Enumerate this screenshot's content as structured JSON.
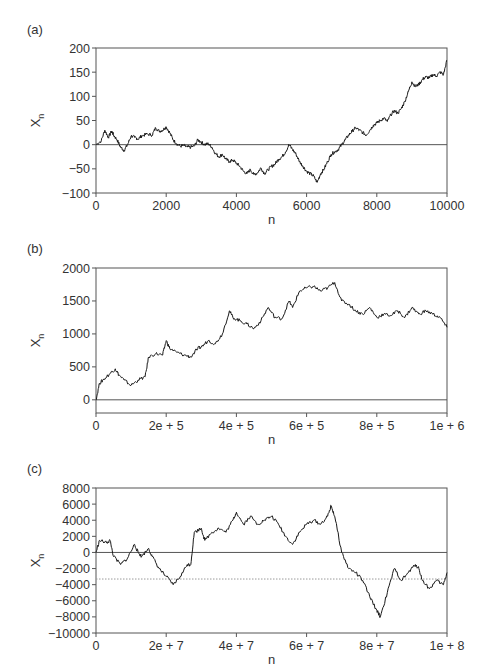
{
  "chart_data": [
    {
      "panel": "(a)",
      "type": "line",
      "title": "",
      "xlabel": "n",
      "ylabel": "X_n",
      "xlim": [
        0,
        10000
      ],
      "ylim": [
        -100,
        200
      ],
      "xticks": [
        "0",
        "2000",
        "4000",
        "6000",
        "8000",
        "10000"
      ],
      "yticks": [
        "200",
        "150",
        "100",
        "50",
        "0",
        "−50",
        "−100"
      ],
      "grid": false,
      "reference_lines": [
        {
          "y": 0,
          "style": "solid"
        }
      ],
      "series": [
        {
          "name": "random walk",
          "x": [
            0,
            150,
            250,
            350,
            450,
            500,
            600,
            700,
            800,
            900,
            1000,
            1100,
            1200,
            1300,
            1450,
            1600,
            1700,
            1800,
            1900,
            2000,
            2100,
            2200,
            2300,
            2400,
            2500,
            2600,
            2700,
            2800,
            2900,
            3000,
            3100,
            3200,
            3300,
            3400,
            3500,
            3600,
            3700,
            3800,
            3900,
            4000,
            4100,
            4200,
            4300,
            4400,
            4500,
            4600,
            4700,
            4800,
            4900,
            5000,
            5100,
            5200,
            5300,
            5400,
            5500,
            5600,
            5700,
            5800,
            5900,
            6000,
            6100,
            6200,
            6300,
            6400,
            6500,
            6600,
            6700,
            6800,
            6900,
            7000,
            7100,
            7200,
            7300,
            7400,
            7500,
            7600,
            7700,
            7800,
            7900,
            8000,
            8100,
            8200,
            8300,
            8400,
            8500,
            8600,
            8700,
            8800,
            8900,
            9000,
            9100,
            9200,
            9300,
            9400,
            9500,
            9600,
            9700,
            9800,
            9900,
            10000
          ],
          "values": [
            0,
            8,
            30,
            15,
            28,
            20,
            10,
            -5,
            -12,
            0,
            18,
            15,
            12,
            18,
            22,
            20,
            35,
            28,
            30,
            37,
            25,
            10,
            2,
            -3,
            -2,
            -5,
            -5,
            -3,
            10,
            5,
            0,
            2,
            -5,
            -18,
            -25,
            -20,
            -30,
            -35,
            -32,
            -38,
            -45,
            -55,
            -60,
            -52,
            -62,
            -58,
            -48,
            -60,
            -52,
            -45,
            -40,
            -30,
            -25,
            -15,
            0,
            -10,
            -20,
            -35,
            -45,
            -55,
            -60,
            -65,
            -78,
            -60,
            -50,
            -35,
            -20,
            -15,
            -10,
            0,
            10,
            20,
            28,
            35,
            30,
            25,
            20,
            30,
            40,
            45,
            50,
            55,
            48,
            62,
            70,
            65,
            75,
            90,
            110,
            130,
            120,
            125,
            135,
            140,
            138,
            145,
            142,
            150,
            145,
            175
          ]
        }
      ]
    },
    {
      "panel": "(b)",
      "type": "line",
      "title": "",
      "xlabel": "n",
      "ylabel": "X_n",
      "xlim": [
        0,
        1000000
      ],
      "ylim": [
        -200,
        2000
      ],
      "xticks": [
        "0",
        "2e+5",
        "4e+5",
        "6e+5",
        "8e+5",
        "1e+6"
      ],
      "yticks": [
        "2000",
        "1500",
        "1000",
        "500",
        "0"
      ],
      "grid": false,
      "reference_lines": [
        {
          "y": 0,
          "style": "solid"
        }
      ],
      "series": [
        {
          "name": "random walk",
          "x": [
            0,
            10000,
            20000,
            40000,
            55000,
            65000,
            80000,
            100000,
            120000,
            140000,
            150000,
            170000,
            190000,
            200000,
            210000,
            230000,
            250000,
            270000,
            290000,
            300000,
            320000,
            340000,
            360000,
            380000,
            390000,
            410000,
            430000,
            450000,
            470000,
            490000,
            510000,
            530000,
            550000,
            560000,
            580000,
            600000,
            620000,
            640000,
            660000,
            680000,
            700000,
            720000,
            740000,
            760000,
            780000,
            800000,
            820000,
            840000,
            860000,
            880000,
            900000,
            920000,
            940000,
            960000,
            980000,
            1000000
          ],
          "values": [
            0,
            250,
            300,
            400,
            470,
            380,
            300,
            220,
            300,
            350,
            650,
            700,
            680,
            900,
            780,
            720,
            680,
            650,
            780,
            800,
            900,
            850,
            1000,
            1350,
            1250,
            1200,
            1150,
            1080,
            1200,
            1400,
            1250,
            1230,
            1500,
            1400,
            1650,
            1700,
            1720,
            1650,
            1700,
            1780,
            1500,
            1450,
            1350,
            1300,
            1400,
            1250,
            1300,
            1280,
            1350,
            1250,
            1400,
            1300,
            1350,
            1300,
            1250,
            1100
          ]
        }
      ]
    },
    {
      "panel": "(c)",
      "type": "line",
      "title": "",
      "xlabel": "n",
      "ylabel": "X_n",
      "xlim": [
        0,
        100000000
      ],
      "ylim": [
        -10000,
        8000
      ],
      "xticks": [
        "0",
        "2e+7",
        "4e+7",
        "6e+7",
        "8e+7",
        "1e+8"
      ],
      "yticks": [
        "8000",
        "6000",
        "4000",
        "2000",
        "0",
        "−2000",
        "−4000",
        "−6000",
        "−8000",
        "−10000"
      ],
      "grid": false,
      "reference_lines": [
        {
          "y": 0,
          "style": "solid"
        },
        {
          "y": -3300,
          "style": "dotted"
        }
      ],
      "series": [
        {
          "name": "random walk",
          "x": [
            0,
            1000000,
            3000000,
            4000000,
            5000000,
            7000000,
            9000000,
            11000000,
            12000000,
            13000000,
            15000000,
            16000000,
            18000000,
            20000000,
            22000000,
            24000000,
            26000000,
            27000000,
            28000000,
            30000000,
            31000000,
            33000000,
            35000000,
            37000000,
            39000000,
            40000000,
            42000000,
            44000000,
            46000000,
            48000000,
            50000000,
            52000000,
            54000000,
            56000000,
            58000000,
            60000000,
            62000000,
            64000000,
            66000000,
            67000000,
            68000000,
            70000000,
            72000000,
            74000000,
            76000000,
            78000000,
            80000000,
            81000000,
            83000000,
            85000000,
            87000000,
            89000000,
            91000000,
            92000000,
            93000000,
            95000000,
            97000000,
            99000000,
            100000000
          ],
          "values": [
            0,
            1500,
            1200,
            1500,
            -500,
            -1500,
            -700,
            1000,
            0,
            -500,
            500,
            -500,
            -2000,
            -3000,
            -4000,
            -3000,
            -1500,
            -1500,
            2500,
            3000,
            1500,
            2500,
            3000,
            2500,
            4000,
            5000,
            3500,
            4500,
            3500,
            4000,
            4500,
            3500,
            2000,
            1000,
            2500,
            3500,
            4000,
            3500,
            4500,
            5800,
            4500,
            0,
            -2000,
            -2500,
            -3500,
            -5500,
            -7200,
            -8000,
            -5000,
            -2000,
            -3500,
            -2500,
            -1500,
            -2000,
            -3500,
            -4500,
            -3500,
            -4000,
            -2500
          ]
        }
      ]
    }
  ],
  "panels": [
    {
      "label": "(a)",
      "xlabel": "n",
      "ylabel_main": "X",
      "ylabel_sub": "n",
      "xticks": [
        "0",
        "2000",
        "4000",
        "6000",
        "8000",
        "10000"
      ],
      "yticks": [
        "200",
        "150",
        "100",
        "50",
        "0",
        "−50",
        "−100"
      ]
    },
    {
      "label": "(b)",
      "xlabel": "n",
      "ylabel_main": "X",
      "ylabel_sub": "n",
      "xticks": [
        "0",
        "2e + 5",
        "4e + 5",
        "6e + 5",
        "8e + 5",
        "1e + 6"
      ],
      "yticks": [
        "2000",
        "1500",
        "1000",
        "500",
        "0"
      ]
    },
    {
      "label": "(c)",
      "xlabel": "n",
      "ylabel_main": "X",
      "ylabel_sub": "n",
      "xticks": [
        "0",
        "2e + 7",
        "4e + 7",
        "6e + 7",
        "8e + 7",
        "1e + 8"
      ],
      "yticks": [
        "8000",
        "6000",
        "4000",
        "2000",
        "0",
        "−2000",
        "−4000",
        "−6000",
        "−8000",
        "−10000"
      ]
    }
  ],
  "colors": {
    "line": "#1a1a1a",
    "axis": "#555555",
    "text": "#333333"
  }
}
